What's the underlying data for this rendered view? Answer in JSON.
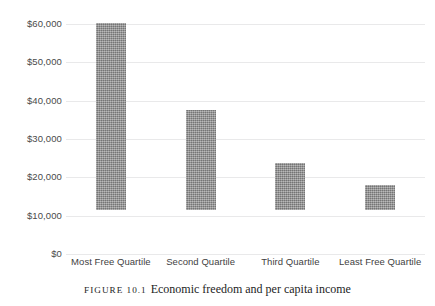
{
  "figure": {
    "caption_number": "Figure 10.1",
    "caption_text": "Economic freedom and per capita income"
  },
  "chart_data": {
    "type": "bar",
    "title": "Economic freedom and per capita income",
    "xlabel": "",
    "ylabel": "",
    "categories": [
      "Most Free Quartile",
      "Second Quartile",
      "Third Quartile",
      "Least Free Quartile"
    ],
    "values": [
      48700,
      26000,
      12300,
      6500
    ],
    "ylim": [
      0,
      60000
    ],
    "ytick_values": [
      0,
      10000,
      20000,
      30000,
      40000,
      50000,
      60000
    ],
    "ytick_labels": [
      "$0",
      "$10,000",
      "$20,000",
      "$30,000",
      "$40,000",
      "$50,000",
      "$60,000"
    ],
    "grid": true,
    "legend": "none",
    "bar_color": "#8f8f8f",
    "gridline_color": "#e9e9ea",
    "text_color": "#3f3f3f"
  }
}
